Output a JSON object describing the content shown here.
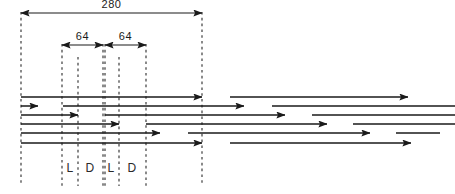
{
  "figure": {
    "background_color": "#ffffff",
    "line_color": "#1a1a1a",
    "dash_color": "#2b2b2b",
    "width": 455,
    "height": 194
  },
  "dimensions": {
    "overall": {
      "label": "280",
      "x_start": 21,
      "x_end": 202,
      "y": 13
    },
    "segments": [
      {
        "label": "64",
        "x_start": 62,
        "x_end": 103,
        "y": 45
      },
      {
        "label": "64",
        "x_start": 105,
        "x_end": 146,
        "y": 45
      }
    ]
  },
  "zone_labels": [
    {
      "label": "L",
      "x": 70,
      "y": 172
    },
    {
      "label": "D",
      "x": 90,
      "y": 172
    },
    {
      "label": "L",
      "x": 111,
      "y": 172
    },
    {
      "label": "D",
      "x": 132,
      "y": 172
    }
  ],
  "guide_lines": [
    {
      "name": "datum-left",
      "x": 21,
      "y_top": 12,
      "y_bottom": 186
    },
    {
      "name": "zone-l1-start",
      "x": 62,
      "y_top": 44,
      "y_bottom": 186
    },
    {
      "name": "zone-l1-end",
      "x": 78,
      "y_top": 57,
      "y_bottom": 186
    },
    {
      "name": "zone-d1-end",
      "x": 103,
      "y_top": 44,
      "y_bottom": 186
    },
    {
      "name": "zone-l2-start",
      "x": 105,
      "y_top": 44,
      "y_bottom": 186
    },
    {
      "name": "zone-l2-end",
      "x": 119,
      "y_top": 57,
      "y_bottom": 186
    },
    {
      "name": "zone-d2-end",
      "x": 146,
      "y_top": 44,
      "y_bottom": 186
    },
    {
      "name": "datum-right",
      "x": 202,
      "y_top": 12,
      "y_bottom": 186
    }
  ],
  "chart_data": {
    "type": "bar",
    "xlabel": "",
    "ylabel": "",
    "categories": [
      "row-1",
      "row-2",
      "row-3",
      "row-4",
      "row-5",
      "row-6"
    ],
    "values": [
      181,
      17,
      57,
      98,
      139,
      181
    ],
    "axis_units": "px",
    "grid": false,
    "legend": null
  },
  "rows": [
    {
      "name": "row-1",
      "y": 97,
      "primary": {
        "x_start": 21,
        "x_end": 202,
        "arrow": true
      },
      "secondary": {
        "x_start": 230,
        "x_end": 408,
        "arrow": true
      },
      "tail": null
    },
    {
      "name": "row-2",
      "y": 106,
      "primary": {
        "x_start": 21,
        "x_end": 38,
        "arrow": true
      },
      "secondary": {
        "x_start": 63,
        "x_end": 244,
        "arrow": true
      },
      "tail": {
        "x_start": 272,
        "x_end": 455
      }
    },
    {
      "name": "row-3",
      "y": 115,
      "primary": {
        "x_start": 21,
        "x_end": 78,
        "arrow": true
      },
      "secondary": {
        "x_start": 105,
        "x_end": 285,
        "arrow": true
      },
      "tail": {
        "x_start": 312,
        "x_end": 455
      }
    },
    {
      "name": "row-4",
      "y": 124,
      "primary": {
        "x_start": 21,
        "x_end": 119,
        "arrow": true
      },
      "secondary": {
        "x_start": 146,
        "x_end": 327,
        "arrow": true
      },
      "tail": {
        "x_start": 353,
        "x_end": 455
      }
    },
    {
      "name": "row-5",
      "y": 133,
      "primary": {
        "x_start": 21,
        "x_end": 160,
        "arrow": true
      },
      "secondary": {
        "x_start": 188,
        "x_end": 370,
        "arrow": true
      },
      "tail": {
        "x_start": 396,
        "x_end": 440
      }
    },
    {
      "name": "row-6",
      "y": 143,
      "primary": {
        "x_start": 21,
        "x_end": 202,
        "arrow": true
      },
      "secondary": {
        "x_start": 230,
        "x_end": 411,
        "arrow": true
      },
      "tail": null
    }
  ]
}
